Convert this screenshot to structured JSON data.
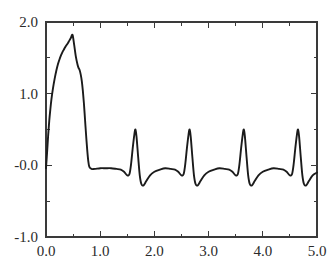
{
  "chart_data": {
    "type": "line",
    "title": "",
    "subtitle": "",
    "xlabel": "",
    "ylabel": "",
    "xlim": [
      0.0,
      5.0
    ],
    "ylim": [
      -1.0,
      2.0
    ],
    "grid": false,
    "legend": null,
    "legend_position": "none",
    "x_tick_labels": [
      "0.0",
      "1.0",
      "2.0",
      "3.0",
      "4.0",
      "5.0"
    ],
    "x_tick_values": [
      0.0,
      1.0,
      2.0,
      3.0,
      4.0,
      5.0
    ],
    "x_minor_tick_values": [
      0.5,
      1.5,
      2.5,
      3.5,
      4.5
    ],
    "y_tick_labels": [
      "-1.0",
      "-0.0",
      "1.0",
      "2.0"
    ],
    "y_tick_values": [
      -1.0,
      0.0,
      1.0,
      2.0
    ],
    "y_minor_tick_values": [
      -0.5,
      0.5,
      1.5
    ],
    "line_color": "#1b1b1b",
    "axis_color": "#3a3a3a",
    "background_color": "#ffffff",
    "series": [
      {
        "name": "waveform",
        "x": [
          0.0,
          0.02,
          0.04,
          0.06,
          0.08,
          0.1,
          0.13,
          0.16,
          0.19,
          0.22,
          0.25,
          0.28,
          0.31,
          0.34,
          0.37,
          0.4,
          0.43,
          0.46,
          0.49,
          0.52,
          0.55,
          0.58,
          0.6,
          0.62,
          0.64,
          0.66,
          0.68,
          0.7,
          0.72,
          0.74,
          0.76,
          0.78,
          0.8,
          0.84,
          0.9,
          1.0,
          1.1,
          1.2,
          1.3,
          1.38,
          1.44,
          1.5,
          1.54,
          1.57,
          1.6,
          1.63,
          1.65,
          1.67,
          1.7,
          1.73,
          1.76,
          1.8,
          1.85,
          1.92,
          2.0,
          2.1,
          2.2,
          2.3,
          2.38,
          2.44,
          2.5,
          2.54,
          2.57,
          2.6,
          2.63,
          2.65,
          2.67,
          2.7,
          2.73,
          2.76,
          2.8,
          2.85,
          2.92,
          3.0,
          3.1,
          3.2,
          3.3,
          3.38,
          3.44,
          3.5,
          3.54,
          3.57,
          3.6,
          3.63,
          3.65,
          3.67,
          3.7,
          3.73,
          3.76,
          3.8,
          3.85,
          3.92,
          4.0,
          4.1,
          4.2,
          4.3,
          4.38,
          4.44,
          4.5,
          4.54,
          4.57,
          4.6,
          4.63,
          4.65,
          4.67,
          4.7,
          4.73,
          4.76,
          4.8,
          4.85,
          4.92,
          5.0
        ],
        "y": [
          -0.04,
          0.18,
          0.42,
          0.62,
          0.78,
          0.92,
          1.08,
          1.21,
          1.32,
          1.41,
          1.48,
          1.54,
          1.59,
          1.63,
          1.67,
          1.7,
          1.74,
          1.78,
          1.82,
          1.68,
          1.52,
          1.41,
          1.36,
          1.33,
          1.27,
          1.18,
          1.04,
          0.86,
          0.64,
          0.42,
          0.22,
          0.06,
          -0.02,
          -0.05,
          -0.05,
          -0.04,
          -0.04,
          -0.04,
          -0.05,
          -0.06,
          -0.09,
          -0.14,
          -0.12,
          0.02,
          0.24,
          0.43,
          0.5,
          0.4,
          0.12,
          -0.14,
          -0.26,
          -0.28,
          -0.22,
          -0.14,
          -0.09,
          -0.06,
          -0.04,
          -0.05,
          -0.06,
          -0.09,
          -0.14,
          -0.12,
          0.02,
          0.24,
          0.43,
          0.5,
          0.4,
          0.12,
          -0.14,
          -0.26,
          -0.28,
          -0.22,
          -0.14,
          -0.09,
          -0.06,
          -0.04,
          -0.05,
          -0.06,
          -0.09,
          -0.14,
          -0.12,
          0.02,
          0.24,
          0.43,
          0.5,
          0.4,
          0.12,
          -0.14,
          -0.26,
          -0.28,
          -0.22,
          -0.14,
          -0.09,
          -0.06,
          -0.04,
          -0.05,
          -0.06,
          -0.09,
          -0.14,
          -0.12,
          0.02,
          0.24,
          0.43,
          0.5,
          0.4,
          0.12,
          -0.14,
          -0.26,
          -0.28,
          -0.22,
          -0.14,
          -0.1
        ]
      }
    ],
    "annotations": []
  },
  "figure": {
    "plot_area": {
      "left": 46,
      "top": 22,
      "right": 317,
      "bottom": 237
    }
  }
}
